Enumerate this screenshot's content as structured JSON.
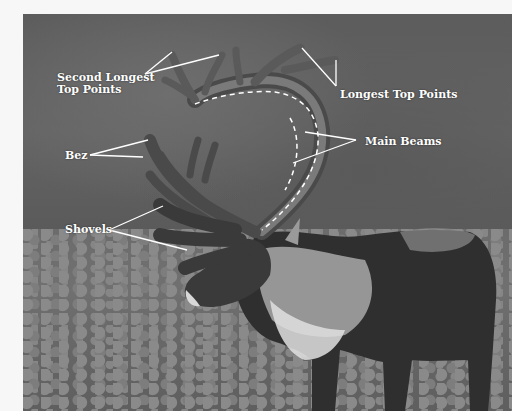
{
  "image": {
    "description": "Photograph of a caribou with labeled antler anatomy",
    "labels": {
      "second_longest_top_points_line1": "Second Longest",
      "second_longest_top_points_line2": "Top Points",
      "longest_top_points": "Longest Top Points",
      "bez": "Bez",
      "main_beams": "Main Beams",
      "shovels": "Shovels"
    },
    "colors": {
      "label_text": "#ffffff",
      "pointer_lines": "#ffffff",
      "background_border": "#f7f7f7"
    }
  }
}
